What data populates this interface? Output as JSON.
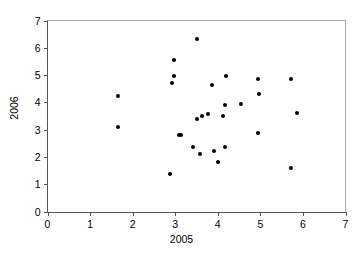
{
  "chart_data": {
    "type": "scatter",
    "title": "",
    "xlabel": "2005",
    "ylabel": "2006",
    "xlim": [
      0,
      7
    ],
    "ylim": [
      0,
      7
    ],
    "xticks": [
      0,
      1,
      2,
      3,
      4,
      5,
      6,
      7
    ],
    "yticks": [
      0,
      1,
      2,
      3,
      4,
      5,
      6,
      7
    ],
    "xtick_labels": [
      "0",
      "1",
      "2",
      "3",
      "4",
      "5",
      "6",
      "7"
    ],
    "ytick_labels": [
      "0",
      "1",
      "2",
      "3",
      "4",
      "5",
      "6",
      "7"
    ],
    "grid": false,
    "legend": false,
    "marker": "filled-circle",
    "marker_color": "#000000",
    "axis_color": "#555555",
    "background": "#ffffff",
    "series": [
      {
        "name": "observations",
        "points": [
          [
            1.65,
            4.25
          ],
          [
            1.65,
            3.08
          ],
          [
            2.87,
            1.39
          ],
          [
            2.92,
            4.71
          ],
          [
            2.96,
            5.56
          ],
          [
            2.96,
            4.97
          ],
          [
            3.08,
            2.8
          ],
          [
            3.13,
            2.8
          ],
          [
            3.41,
            2.38
          ],
          [
            3.51,
            6.34
          ],
          [
            3.52,
            3.38
          ],
          [
            3.59,
            2.11
          ],
          [
            3.63,
            3.5
          ],
          [
            3.78,
            3.57
          ],
          [
            3.86,
            4.64
          ],
          [
            3.92,
            2.23
          ],
          [
            4.0,
            1.83
          ],
          [
            4.13,
            3.5
          ],
          [
            4.17,
            3.9
          ],
          [
            4.17,
            2.38
          ],
          [
            4.19,
            4.97
          ],
          [
            4.54,
            3.95
          ],
          [
            4.95,
            4.86
          ],
          [
            4.97,
            4.31
          ],
          [
            4.95,
            2.88
          ],
          [
            5.71,
            4.86
          ],
          [
            5.71,
            1.59
          ],
          [
            5.87,
            3.62
          ]
        ]
      }
    ]
  }
}
